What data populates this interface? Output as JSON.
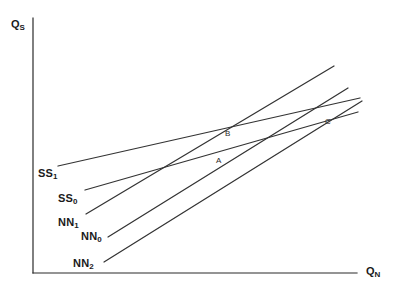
{
  "figure": {
    "type": "line-diagram",
    "background_color": "#ffffff",
    "line_color": "#333333",
    "axis_color": "#2b2b2b",
    "width": 403,
    "height": 295
  },
  "axes": {
    "y_axis": {
      "label_text": "Q",
      "label_subscript": "S",
      "label_full": "QS",
      "x": 33,
      "top_y": 18,
      "bottom_y": 273,
      "label_pos": {
        "x": 11,
        "y": 19
      }
    },
    "x_axis": {
      "label_text": "Q",
      "label_subscript": "N",
      "label_full": "QN",
      "y": 273,
      "left_x": 33,
      "right_x": 357,
      "label_pos": {
        "x": 366,
        "y": 266
      }
    }
  },
  "curves": [
    {
      "id": "SS1",
      "name_text": "SS",
      "name_subscript": "1",
      "name_full": "SS1",
      "label_pos": {
        "x": 38,
        "y": 168
      },
      "x1": 58,
      "y1": 166,
      "x2": 360,
      "y2": 98
    },
    {
      "id": "SS0",
      "name_text": "SS",
      "name_subscript": "0",
      "name_full": "SS0",
      "label_pos": {
        "x": 58,
        "y": 193
      },
      "x1": 85,
      "y1": 190,
      "x2": 358,
      "y2": 112
    },
    {
      "id": "NN1",
      "name_text": "NN",
      "name_subscript": "1",
      "name_full": "NN1",
      "label_pos": {
        "x": 58,
        "y": 217
      },
      "x1": 86,
      "y1": 214,
      "x2": 334,
      "y2": 66
    },
    {
      "id": "NN0",
      "name_text": "NN",
      "name_subscript": "0",
      "name_full": "NN0",
      "label_pos": {
        "x": 81,
        "y": 231
      },
      "x1": 108,
      "y1": 237,
      "x2": 348,
      "y2": 88
    },
    {
      "id": "NN2",
      "name_text": "NN",
      "name_subscript": "2",
      "name_full": "NN2",
      "label_pos": {
        "x": 73,
        "y": 258
      },
      "x1": 104,
      "y1": 262,
      "x2": 362,
      "y2": 101
    }
  ],
  "points": [
    {
      "id": "A",
      "label": "A",
      "x": 219,
      "y": 159,
      "label_pos": {
        "x": 216,
        "y": 157
      }
    },
    {
      "id": "B",
      "label": "B",
      "x": 228,
      "y": 134,
      "label_pos": {
        "x": 225,
        "y": 130
      }
    },
    {
      "id": "C",
      "label": "C",
      "x": 329,
      "y": 121,
      "label_pos": {
        "x": 325,
        "y": 118
      }
    }
  ]
}
